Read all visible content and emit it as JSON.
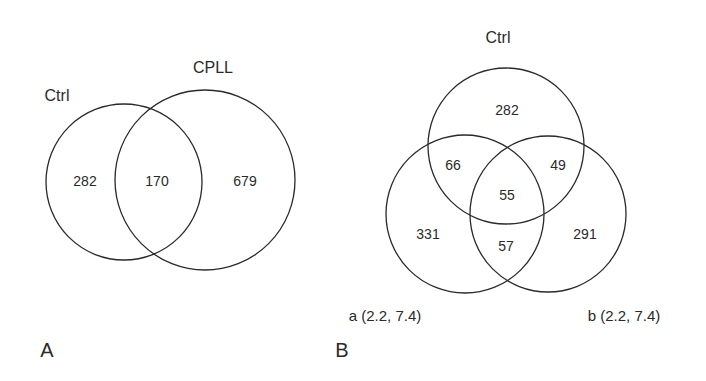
{
  "panel_a": {
    "letter": "A",
    "sets": {
      "ctrl": "Ctrl",
      "cpll": "CPLL"
    },
    "regions": {
      "ctrl_only": "282",
      "ctrl_cpll": "170",
      "cpll_only": "679"
    }
  },
  "panel_b": {
    "letter": "B",
    "sets": {
      "ctrl": "Ctrl",
      "a": "a (2.2, 7.4)",
      "b": "b (2.2, 7.4)"
    },
    "regions": {
      "ctrl_only": "282",
      "ctrl_a": "66",
      "ctrl_b": "49",
      "ctrl_a_b": "55",
      "a_only": "331",
      "a_b": "57",
      "b_only": "291"
    }
  },
  "colors": {
    "line": "#2a2a2a",
    "background": "#ffffff"
  }
}
